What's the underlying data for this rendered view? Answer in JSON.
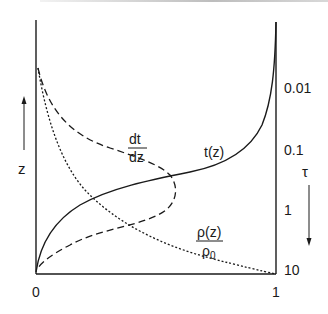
{
  "figure": {
    "x_axis": {
      "tick_min": "0",
      "tick_max": "1"
    },
    "left_axis": {
      "label": "z",
      "arrow": "up"
    },
    "right_axis": {
      "label": "τ",
      "arrow": "down",
      "ticks": [
        "0.01",
        "0.1",
        "1",
        "10"
      ]
    },
    "curves": {
      "t": {
        "label": "t(z)",
        "style": "solid"
      },
      "dtdz": {
        "label_num": "dt",
        "label_den": "dz",
        "style": "dashed"
      },
      "rho": {
        "label_num": "ρ(z)",
        "label_den": "ρ",
        "label_den_sub": "0",
        "style": "dotted"
      }
    }
  }
}
